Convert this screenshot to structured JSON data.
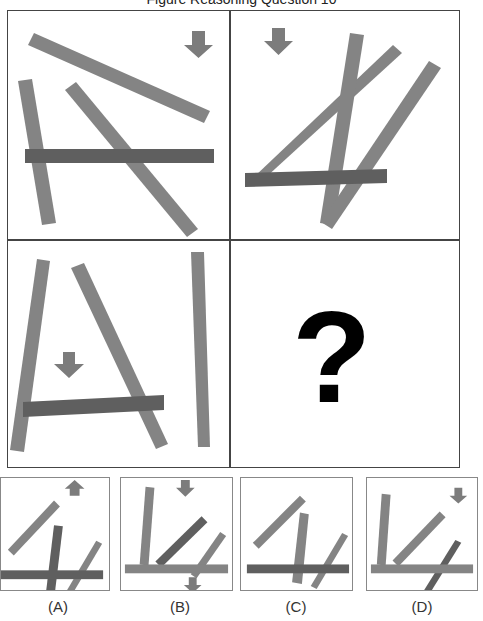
{
  "title": "Figure Reasoning Question 10",
  "colors": {
    "bar_light": "#848484",
    "bar_dark": "#5f5f5f",
    "arrow": "#7c7c7c",
    "border": "#444444",
    "question_mark": "#000000"
  },
  "grid": {
    "cells": [
      {
        "name": "cell-1",
        "arrow_direction": "down"
      },
      {
        "name": "cell-2",
        "arrow_direction": "down"
      },
      {
        "name": "cell-3",
        "arrow_direction": "down"
      },
      {
        "name": "cell-4",
        "content": "?"
      }
    ]
  },
  "options": [
    {
      "label": "(A)",
      "arrow_direction": "up"
    },
    {
      "label": "(B)",
      "arrow_direction": "down"
    },
    {
      "label": "(C)",
      "arrow_direction": "none"
    },
    {
      "label": "(D)",
      "arrow_direction": "down"
    }
  ]
}
